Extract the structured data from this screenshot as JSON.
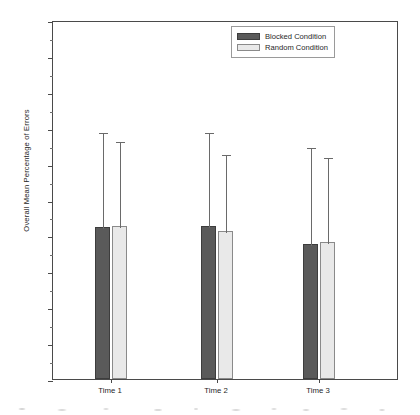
{
  "chart_data": {
    "type": "bar",
    "title": "",
    "xlabel": "",
    "ylabel": "Overall Mean Percentage of Errors",
    "categories": [
      "Time 1",
      "Time 2",
      "Time 3"
    ],
    "ylim": [
      0,
      100
    ],
    "y_ticks": [
      0,
      10,
      20,
      30,
      40,
      50,
      60,
      70,
      80,
      90,
      100
    ],
    "y_minor_tick_step": 5,
    "grid": false,
    "legend_position": "top-right",
    "error_bars": "upper-only",
    "series": [
      {
        "name": "Blocked Condition",
        "color": "#5a5a5a",
        "values": [
          42.3,
          42.6,
          37.5
        ],
        "error_upper": [
          69.0,
          69.0,
          65.0
        ]
      },
      {
        "name": "Random Condition",
        "color": "#e9e9e9",
        "values": [
          42.6,
          41.2,
          38.2
        ],
        "error_upper": [
          66.5,
          63.0,
          62.0
        ]
      }
    ]
  },
  "legend": {
    "entries": [
      {
        "label": "Blocked Condition",
        "swatch": "blocked"
      },
      {
        "label": "Random Condition",
        "swatch": "random"
      }
    ]
  },
  "axis": {
    "y_title": "Overall Mean Percentage of Errors",
    "y_labels": [
      "100",
      "90",
      "80",
      "70",
      "60",
      "50",
      "40",
      "30",
      "20",
      "10",
      "0"
    ],
    "x_labels": [
      "Time 1",
      "Time 2",
      "Time 3"
    ]
  }
}
